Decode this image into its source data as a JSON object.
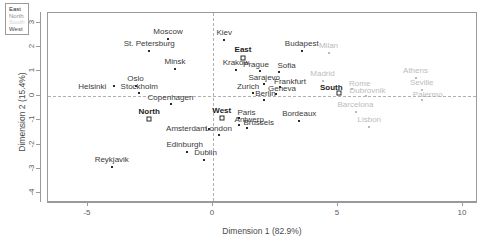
{
  "chart_data": {
    "type": "scatter",
    "title": "",
    "xlabel": "Dimension 1 (82.9%)",
    "ylabel": "Dimension 2 (15.4%)",
    "xlim": [
      -6.6,
      10.6
    ],
    "ylim": [
      -4.4,
      3.4
    ],
    "xticks": [
      -5,
      0,
      5,
      10
    ],
    "xtick_labels": [
      "-5",
      "0",
      "5",
      "10"
    ],
    "yticks": [
      3,
      2,
      1,
      0,
      -1,
      -2,
      -3,
      -4
    ],
    "ytick_labels": [
      "3",
      "2",
      "1",
      "0",
      "-1",
      "-2",
      "-3",
      "-4"
    ],
    "grid": false,
    "reference_lines": {
      "vertical_x": 0,
      "horizontal_y": 0,
      "style": "dashed"
    },
    "legend": {
      "position": "top-left",
      "entries": [
        {
          "label": "East",
          "color": "#2b2b2b"
        },
        {
          "label": "North",
          "color": "#8f8f8f"
        },
        {
          "label": "South",
          "color": "#d2d2d2"
        },
        {
          "label": "West",
          "color": "#4a4a4a"
        }
      ]
    },
    "series": [
      {
        "name": "group-centroids",
        "marker": "hollow-square",
        "style": "bold",
        "points": [
          {
            "label": "East",
            "x": 1.2,
            "y": 1.55
          },
          {
            "label": "North",
            "x": -2.55,
            "y": -0.95
          },
          {
            "label": "West",
            "x": 0.35,
            "y": -0.9
          },
          {
            "label": "South",
            "x": 5.05,
            "y": 0.12
          }
        ]
      },
      {
        "name": "east-cities",
        "marker": "filled-square",
        "style": "dark",
        "points": [
          {
            "label": "Moscow",
            "x": -1.8,
            "y": 2.32
          },
          {
            "label": "Kiev",
            "x": 0.45,
            "y": 2.3
          },
          {
            "label": "St. Petersburg",
            "x": -2.55,
            "y": 1.82
          },
          {
            "label": "Minsk",
            "x": -1.52,
            "y": 1.12
          },
          {
            "label": "Krakow",
            "x": 0.92,
            "y": 1.05
          },
          {
            "label": "Prague",
            "x": 1.88,
            "y": 1.0
          },
          {
            "label": "Sofia",
            "x": 2.62,
            "y": 0.98
          },
          {
            "label": "Budapest",
            "x": 3.55,
            "y": 1.82
          },
          {
            "label": "Sarajevo",
            "x": 2.05,
            "y": 0.48
          }
        ]
      },
      {
        "name": "north-cities",
        "marker": "filled-square",
        "style": "dark",
        "points": [
          {
            "label": "Helsinki",
            "x": -3.95,
            "y": 0.4
          },
          {
            "label": "Oslo",
            "x": -3.1,
            "y": 0.4
          },
          {
            "label": "Stockholm",
            "x": -2.95,
            "y": 0.12
          },
          {
            "label": "Copenhagen",
            "x": -1.7,
            "y": -0.35
          },
          {
            "label": "Edinburgh",
            "x": -1.05,
            "y": -2.3
          },
          {
            "label": "Dublin",
            "x": -0.38,
            "y": -2.62
          },
          {
            "label": "Reykjavik",
            "x": -4.05,
            "y": -2.92
          }
        ]
      },
      {
        "name": "west-cities",
        "marker": "filled-square",
        "style": "dark",
        "points": [
          {
            "label": "Zurich",
            "x": 1.6,
            "y": 0.12
          },
          {
            "label": "Geneva",
            "x": 2.52,
            "y": 0.08
          },
          {
            "label": "Frankfurt",
            "x": 2.68,
            "y": 0.35
          },
          {
            "label": "Berlin",
            "x": 2.02,
            "y": -0.18
          },
          {
            "label": "Paris",
            "x": 1.02,
            "y": -0.92
          },
          {
            "label": "Antwerp",
            "x": 1.05,
            "y": -1.18
          },
          {
            "label": "Brussels",
            "x": 1.35,
            "y": -1.32
          },
          {
            "label": "Amsterdam",
            "x": -0.18,
            "y": -1.38
          },
          {
            "label": "London",
            "x": 0.22,
            "y": -1.62
          },
          {
            "label": "Bordeaux",
            "x": 3.45,
            "y": -1.02
          }
        ]
      },
      {
        "name": "south-cities",
        "marker": "filled-square",
        "style": "grey",
        "points": [
          {
            "label": "Milan",
            "x": 4.62,
            "y": 1.75
          },
          {
            "label": "Madrid",
            "x": 4.38,
            "y": 0.62
          },
          {
            "label": "Rome",
            "x": 5.55,
            "y": 0.28
          },
          {
            "label": "Dubrovnik",
            "x": 6.1,
            "y": 0.0
          },
          {
            "label": "Athens",
            "x": 8.1,
            "y": 0.72
          },
          {
            "label": "Seville",
            "x": 8.35,
            "y": 0.22
          },
          {
            "label": "Palermo",
            "x": 8.35,
            "y": -0.18
          },
          {
            "label": "Barcelona",
            "x": 5.7,
            "y": -0.68
          },
          {
            "label": "Lisbon",
            "x": 6.25,
            "y": -1.28
          }
        ]
      }
    ]
  }
}
